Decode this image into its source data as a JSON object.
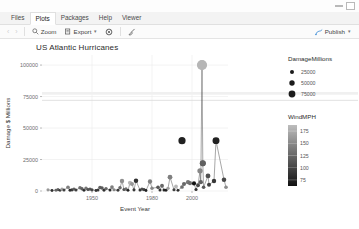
{
  "window": {
    "minimize_label": "minimize",
    "maximize_label": "maximize"
  },
  "tabs": [
    {
      "label": "Files",
      "active": false
    },
    {
      "label": "Plots",
      "active": true
    },
    {
      "label": "Packages",
      "active": false
    },
    {
      "label": "Help",
      "active": false
    },
    {
      "label": "Viewer",
      "active": false
    }
  ],
  "toolbar": {
    "back_label": "‹",
    "forward_label": "›",
    "zoom_label": "Zoom",
    "export_label": "Export",
    "export_caret": "▾",
    "remove_label": "",
    "clear_label": "",
    "publish_label": "Publish",
    "publish_caret": "▾"
  },
  "chart_data": {
    "type": "scatter",
    "title": "US Atlantic Hurricanes",
    "xlabel": "Event Year",
    "ylabel": "Damage $ Millions",
    "xlim": [
      1925,
      2018
    ],
    "ylim": [
      0,
      108000
    ],
    "xticks": [
      1950,
      1980,
      2000
    ],
    "xticklabels": [
      "1950",
      "1980",
      "2000"
    ],
    "yticks": [
      0,
      25000,
      50000,
      75000,
      100000
    ],
    "yticklabels": [
      "0",
      "25000",
      "50000",
      "75000",
      "100000"
    ],
    "grid": true,
    "connected": true,
    "legends": [
      {
        "name": "size-legend",
        "title": "DamageMillions",
        "kind": "size",
        "entries": [
          {
            "label": "25000",
            "value": 25000,
            "radius": 2.0
          },
          {
            "label": "50000",
            "value": 50000,
            "radius": 2.7
          },
          {
            "label": "75000",
            "value": 75000,
            "radius": 3.4
          }
        ]
      },
      {
        "name": "color-legend",
        "title": "WindMPH",
        "kind": "colorbar",
        "ticks": [
          175,
          150,
          125,
          100,
          75
        ],
        "ticklabels": [
          "175",
          "150",
          "125",
          "100",
          "75"
        ],
        "color_low": "#111111",
        "color_high": "#bdbdbd"
      }
    ],
    "points": [
      {
        "x": 1928,
        "y": 900,
        "w": 155
      },
      {
        "x": 1930,
        "y": 400,
        "w": 90
      },
      {
        "x": 1932,
        "y": 600,
        "w": 125
      },
      {
        "x": 1933,
        "y": 1100,
        "w": 120
      },
      {
        "x": 1934,
        "y": 500,
        "w": 95
      },
      {
        "x": 1935,
        "y": 1400,
        "w": 160
      },
      {
        "x": 1936,
        "y": 700,
        "w": 100
      },
      {
        "x": 1938,
        "y": 3000,
        "w": 140
      },
      {
        "x": 1939,
        "y": 600,
        "w": 85
      },
      {
        "x": 1940,
        "y": 900,
        "w": 95
      },
      {
        "x": 1941,
        "y": 1500,
        "w": 120
      },
      {
        "x": 1942,
        "y": 700,
        "w": 100
      },
      {
        "x": 1944,
        "y": 2600,
        "w": 130
      },
      {
        "x": 1945,
        "y": 1800,
        "w": 120
      },
      {
        "x": 1946,
        "y": 500,
        "w": 85
      },
      {
        "x": 1947,
        "y": 2200,
        "w": 135
      },
      {
        "x": 1948,
        "y": 1200,
        "w": 110
      },
      {
        "x": 1949,
        "y": 1500,
        "w": 115
      },
      {
        "x": 1950,
        "y": 900,
        "w": 105
      },
      {
        "x": 1952,
        "y": 400,
        "w": 90
      },
      {
        "x": 1953,
        "y": 800,
        "w": 95
      },
      {
        "x": 1954,
        "y": 2800,
        "w": 120
      },
      {
        "x": 1955,
        "y": 2400,
        "w": 115
      },
      {
        "x": 1956,
        "y": 600,
        "w": 90
      },
      {
        "x": 1957,
        "y": 1900,
        "w": 125
      },
      {
        "x": 1959,
        "y": 700,
        "w": 85
      },
      {
        "x": 1960,
        "y": 3100,
        "w": 140
      },
      {
        "x": 1961,
        "y": 1000,
        "w": 145
      },
      {
        "x": 1963,
        "y": 600,
        "w": 95
      },
      {
        "x": 1964,
        "y": 2500,
        "w": 125
      },
      {
        "x": 1965,
        "y": 8000,
        "w": 150
      },
      {
        "x": 1966,
        "y": 1200,
        "w": 110
      },
      {
        "x": 1967,
        "y": 1600,
        "w": 130
      },
      {
        "x": 1968,
        "y": 500,
        "w": 80
      },
      {
        "x": 1969,
        "y": 6500,
        "w": 175
      },
      {
        "x": 1970,
        "y": 5500,
        "w": 155
      },
      {
        "x": 1971,
        "y": 900,
        "w": 95
      },
      {
        "x": 1972,
        "y": 8200,
        "w": 90
      },
      {
        "x": 1974,
        "y": 700,
        "w": 90
      },
      {
        "x": 1975,
        "y": 1500,
        "w": 110
      },
      {
        "x": 1976,
        "y": 1100,
        "w": 100
      },
      {
        "x": 1977,
        "y": 400,
        "w": 80
      },
      {
        "x": 1979,
        "y": 7500,
        "w": 140
      },
      {
        "x": 1980,
        "y": 2200,
        "w": 145
      },
      {
        "x": 1983,
        "y": 2900,
        "w": 115
      },
      {
        "x": 1984,
        "y": 800,
        "w": 90
      },
      {
        "x": 1985,
        "y": 4200,
        "w": 125
      },
      {
        "x": 1986,
        "y": 700,
        "w": 85
      },
      {
        "x": 1987,
        "y": 600,
        "w": 80
      },
      {
        "x": 1988,
        "y": 2100,
        "w": 160
      },
      {
        "x": 1989,
        "y": 11000,
        "w": 140
      },
      {
        "x": 1991,
        "y": 1000,
        "w": 100
      },
      {
        "x": 1992,
        "y": 3600,
        "w": 175
      },
      {
        "x": 1993,
        "y": 500,
        "w": 85
      },
      {
        "x": 1995,
        "y": 3200,
        "w": 130
      },
      {
        "x": 1996,
        "y": 5500,
        "w": 125
      },
      {
        "x": 1998,
        "y": 7000,
        "w": 135
      },
      {
        "x": 1999,
        "y": 6200,
        "w": 130
      },
      {
        "x": 2001,
        "y": 6000,
        "w": 70
      },
      {
        "x": 2002,
        "y": 1200,
        "w": 90
      },
      {
        "x": 2003,
        "y": 4500,
        "w": 105
      },
      {
        "x": 2004,
        "y": 16000,
        "w": 145
      },
      {
        "x": 2004.4,
        "y": 7000,
        "w": 120
      },
      {
        "x": 2005,
        "y": 100000,
        "w": 175
      },
      {
        "x": 2005.4,
        "y": 22000,
        "w": 120
      },
      {
        "x": 2005.8,
        "y": 3000,
        "w": 115
      },
      {
        "x": 2008,
        "y": 12000,
        "w": 110
      },
      {
        "x": 2008.5,
        "y": 5000,
        "w": 100
      },
      {
        "x": 2011,
        "y": 8000,
        "w": 95
      },
      {
        "x": 2012,
        "y": 40000,
        "w": 80
      },
      {
        "x": 2016,
        "y": 9000,
        "w": 105
      },
      {
        "x": 2017,
        "y": 3000,
        "w": 150
      }
    ],
    "highlight_points": [
      {
        "x": 2005,
        "y": 100000,
        "w": 175,
        "radius": 5.0,
        "label": "Katrina"
      },
      {
        "x": 1995,
        "y": 40000,
        "w": 80,
        "radius": 3.6,
        "label": "Sandy"
      },
      {
        "x": 2005.4,
        "y": 22000,
        "w": 120,
        "radius": 3.0,
        "label": ""
      }
    ]
  }
}
